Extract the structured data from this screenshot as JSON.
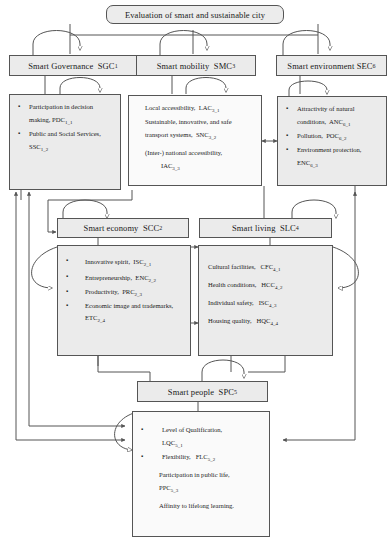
{
  "diagram": {
    "title": "Evaluation of smart and sustainable city"
  },
  "nodes": {
    "governance": {
      "header": "Smart Governance",
      "code": "SGC",
      "code_sub": "1",
      "items": [
        {
          "bullet": true,
          "text": "Participation in decision making,",
          "code": "PDC",
          "code_sub": "1_1"
        },
        {
          "bullet": true,
          "text": "Public and Social Services,",
          "code": "SSC",
          "code_sub": "1_2"
        }
      ]
    },
    "mobility": {
      "header": "Smart mobility",
      "code": "SMC",
      "code_sub": "3",
      "items": [
        {
          "bullet": false,
          "text": "Local accessibility,",
          "code": "LAC",
          "code_sub": "3_1"
        },
        {
          "bullet": false,
          "text": "Sustainable, innovative, and safe transport systems,",
          "code": "SNC",
          "code_sub": "3_2"
        },
        {
          "bullet": false,
          "text": "(Inter-) national accessibility,",
          "code": "IAC",
          "code_sub": "3_3"
        }
      ]
    },
    "environment": {
      "header": "Smart environment",
      "code": "SEC",
      "code_sub": "6",
      "items": [
        {
          "bullet": true,
          "text": "Attractivity of natural conditions,",
          "code": "ANC",
          "code_sub": "6_1"
        },
        {
          "bullet": true,
          "text": "Pollution,",
          "code": "POC",
          "code_sub": "6_2"
        },
        {
          "bullet": true,
          "text": "Environment protection,",
          "code": "ENC",
          "code_sub": "6_3"
        }
      ]
    },
    "economy": {
      "header": "Smart economy",
      "code": "SCC",
      "code_sub": "2",
      "items": [
        {
          "bullet": true,
          "text": "Innovative spirit,",
          "code": "ISC",
          "code_sub": "2_1"
        },
        {
          "bullet": true,
          "text": "Entrepreneurship,",
          "code": "ENC",
          "code_sub": "2_2"
        },
        {
          "bullet": true,
          "text": "Productivity,",
          "code": "PRC",
          "code_sub": "2_3"
        },
        {
          "bullet": true,
          "text": "Economic image and trademarks,",
          "code": "ETC",
          "code_sub": "2_4"
        }
      ]
    },
    "living": {
      "header": "Smart living",
      "code": "SLC",
      "code_sub": "4",
      "items": [
        {
          "bullet": false,
          "text": "Cultural facilities,",
          "code": "CFC",
          "code_sub": "4_1"
        },
        {
          "bullet": false,
          "text": "Health conditions,",
          "code": "HCC",
          "code_sub": "4_2"
        },
        {
          "bullet": false,
          "text": "Individual safety,",
          "code": "ISC",
          "code_sub": "4_3"
        },
        {
          "bullet": false,
          "text": "Housing quality,",
          "code": "HQC",
          "code_sub": "4_4"
        }
      ]
    },
    "people": {
      "header": "Smart people",
      "code": "SPC",
      "code_sub": "5",
      "items": [
        {
          "bullet": true,
          "text": "Level of Qualification,",
          "code": "LQC",
          "code_sub": "5_1"
        },
        {
          "bullet": true,
          "text": "Flexibility,",
          "code": "FLC",
          "code_sub": "5_2"
        },
        {
          "bullet": false,
          "text": "Participation in public life,",
          "code": "PPC",
          "code_sub": "5_3"
        },
        {
          "bullet": false,
          "text": "Affinity to lifelong learning.",
          "code": "",
          "code_sub": ""
        }
      ]
    }
  },
  "style": {
    "line_color": "#555555",
    "box_fill": "#ebebeb",
    "box_fill_light": "#fafafa"
  }
}
